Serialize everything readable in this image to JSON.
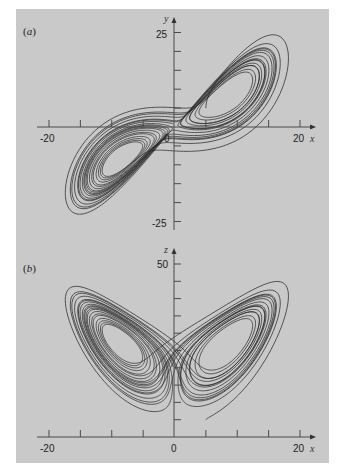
{
  "figure": {
    "background_color": "#c9c9c9",
    "line_color": "#2a2a2a"
  },
  "chart_data": [
    {
      "type": "line",
      "panel_label": "(a)",
      "panel_letter": "a",
      "title": "Lorenz attractor, x-y projection",
      "xlabel": "x",
      "ylabel": "y",
      "xlim": [
        -20,
        20
      ],
      "ylim": [
        -25,
        25
      ],
      "x_tick_labels": [
        "-20",
        "0",
        "20"
      ],
      "y_tick_labels": [
        "25",
        "-25"
      ],
      "x_ticks": [
        -20,
        -15,
        -10,
        -5,
        0,
        5,
        10,
        15,
        20
      ],
      "y_ticks": [
        25,
        20,
        15,
        10,
        5,
        -5,
        -10,
        -15,
        -20,
        -25
      ],
      "grid": false,
      "series": [
        {
          "name": "trajectory",
          "description": "Figure-eight / double-lobe trajectory through origin; lobes centred near (-8.5,-8.5) and (8.5,8.5)"
        }
      ]
    },
    {
      "type": "line",
      "panel_label": "(b)",
      "panel_letter": "b",
      "title": "Lorenz attractor, x-z projection",
      "xlabel": "x",
      "ylabel": "z",
      "xlim": [
        -20,
        20
      ],
      "ylim": [
        0,
        50
      ],
      "x_tick_labels": [
        "-20",
        "0",
        "20"
      ],
      "y_tick_labels": [
        "50"
      ],
      "x_ticks": [
        -20,
        -15,
        -10,
        -5,
        0,
        5,
        10,
        15,
        20
      ],
      "y_ticks": [
        50,
        45,
        40,
        35,
        30,
        25,
        20,
        15,
        10,
        5
      ],
      "grid": false,
      "series": [
        {
          "name": "trajectory",
          "description": "Butterfly-shaped trajectory; wings centred near x=±8.5, z≈27"
        }
      ]
    }
  ]
}
